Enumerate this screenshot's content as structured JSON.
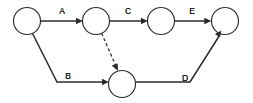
{
  "diagram": {
    "type": "activity-on-arrow-network",
    "colors": {
      "stroke": "#2b2b2b",
      "node_fill": "#ffffff",
      "label": "#1d1d1d",
      "background": "#ffffff"
    },
    "nodes": [
      {
        "id": "n1",
        "label": "",
        "cx": 27,
        "cy": 21,
        "r": 13.5
      },
      {
        "id": "n2",
        "label": "",
        "cx": 96,
        "cy": 21,
        "r": 13.5
      },
      {
        "id": "n3",
        "label": "",
        "cx": 161,
        "cy": 21,
        "r": 13.5
      },
      {
        "id": "n4",
        "label": "",
        "cx": 225,
        "cy": 21,
        "r": 13.5
      },
      {
        "id": "n5",
        "label": "",
        "cx": 122,
        "cy": 84,
        "r": 13.5
      }
    ],
    "edges": [
      {
        "id": "edge-a",
        "label": "A",
        "from": "n1",
        "to": "n2",
        "style": "solid",
        "label_x": 62,
        "label_y": 14
      },
      {
        "id": "edge-c",
        "label": "C",
        "from": "n2",
        "to": "n3",
        "style": "solid",
        "label_x": 128,
        "label_y": 14
      },
      {
        "id": "edge-e",
        "label": "E",
        "from": "n3",
        "to": "n4",
        "style": "solid",
        "label_x": 192,
        "label_y": 14
      },
      {
        "id": "edge-b",
        "label": "B",
        "from": "n1",
        "to": "n5",
        "style": "solid",
        "label_x": 68,
        "label_y": 79
      },
      {
        "id": "edge-d",
        "label": "D",
        "from": "n5",
        "to": "n4",
        "style": "solid",
        "label_x": 185,
        "label_y": 81
      },
      {
        "id": "edge-dummy",
        "label": "",
        "from": "n2",
        "to": "n5",
        "style": "dashed",
        "label_x": 0,
        "label_y": 0
      }
    ]
  }
}
